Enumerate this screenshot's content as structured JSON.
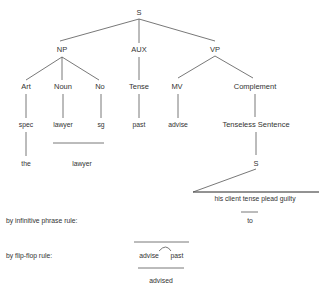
{
  "tree": {
    "root": "S",
    "level1": [
      "NP",
      "AUX",
      "VP"
    ],
    "np_children": [
      "Art",
      "Noun",
      "No"
    ],
    "aux_children": [
      "Tense"
    ],
    "vp_children": [
      "MV",
      "Complement"
    ],
    "art_child": "spec",
    "noun_child": "lawyer",
    "no_child": "sg",
    "tense_child": "past",
    "mv_child": "advise",
    "complement_child": "Tenseless Sentence",
    "spec_child": "the",
    "noun_merged": "lawyer",
    "embedded_root": "S",
    "embedded_string": "his client  tense  plead guilty",
    "embedded_replacement": "to"
  },
  "rules": {
    "infinitive": "by infinitive phrase rule:",
    "flipflop": "by flip-flop rule:",
    "flipflop_word1": "advise",
    "flipflop_word2": "past",
    "flipflop_result": "advised"
  }
}
